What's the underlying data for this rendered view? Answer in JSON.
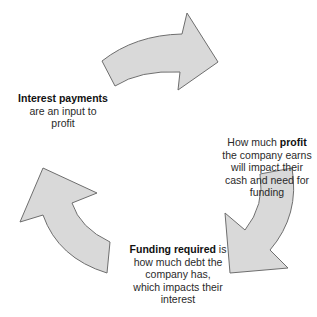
{
  "diagram": {
    "type": "cycle",
    "arrow_fill": "#d9d9d9",
    "arrow_stroke": "#6e6e6e",
    "nodes": [
      {
        "id": "interest",
        "bold": "Interest payments",
        "text": " are an input to profit"
      },
      {
        "id": "profit",
        "pre": "How much ",
        "bold": "profit",
        "text": " the company earns will impact their cash and need for funding"
      },
      {
        "id": "funding",
        "bold": "Funding required",
        "text": " is how much debt the company has, which impacts their interest"
      }
    ],
    "arrows": [
      {
        "from": "interest",
        "to": "profit",
        "direction": "clockwise-top"
      },
      {
        "from": "profit",
        "to": "funding",
        "direction": "clockwise-right"
      },
      {
        "from": "funding",
        "to": "interest",
        "direction": "clockwise-left"
      }
    ]
  }
}
